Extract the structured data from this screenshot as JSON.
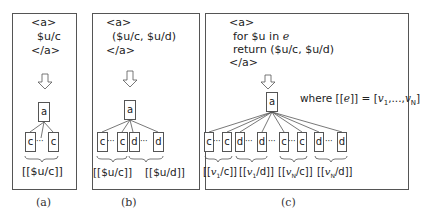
{
  "panels": {
    "a": {
      "code": [
        "<a>",
        "$u/c",
        "</a>"
      ],
      "root": "a",
      "children": [
        "c",
        "c"
      ],
      "ellipsis": "···",
      "groups": [
        "[[$u/c]]"
      ],
      "caption": "(a)"
    },
    "b": {
      "code": [
        "<a>",
        "($u/c, $u/d)",
        "</a>"
      ],
      "root": "a",
      "children": [
        "c",
        "c",
        "d",
        "d"
      ],
      "ellipsis": "···",
      "groups": [
        "[[$u/c]]",
        "[[$u/d]]"
      ],
      "caption": "(b)"
    },
    "c": {
      "code": [
        "<a>",
        "for $u in ",
        "e",
        "return ($u/c, $u/d)",
        "</a>"
      ],
      "root": "a",
      "children": [
        "c",
        "c",
        "d",
        "d",
        "c",
        "c",
        "d",
        "d"
      ],
      "ellipsis": "···",
      "groups": [
        "[[v1/c]]",
        "[[v1/d]]",
        "[[vN/c]]",
        "[[vN/d]]"
      ],
      "where": "where [[e]] = [v1,...,vN]",
      "caption": "(c)"
    }
  },
  "colors": {
    "stroke": "#555555",
    "text": "#222222",
    "background": "#ffffff"
  }
}
